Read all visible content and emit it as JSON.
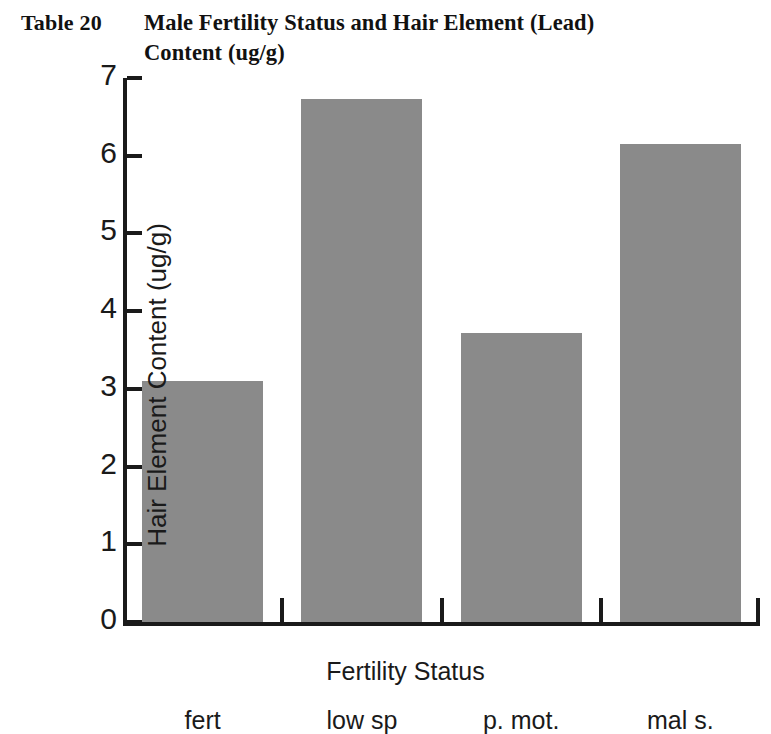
{
  "title": {
    "table_number": "Table 20",
    "line1": "Male Fertility Status and Hair Element (Lead)",
    "line2": "Content (ug/g)"
  },
  "colors": {
    "bar_fill": "#8a8a8a",
    "axis": "#1a1a1a",
    "background": "#ffffff",
    "text": "#1a1a1a"
  },
  "axis": {
    "y_ticks": [
      "0",
      "1",
      "2",
      "3",
      "4",
      "5",
      "6",
      "7"
    ],
    "y_title": "Hair Element Content (ug/g)",
    "x_title": "Fertility Status",
    "x_labels": [
      "fert",
      "low sp",
      "p. mot.",
      "mal s."
    ]
  },
  "chart_data": {
    "type": "bar",
    "title": "Male Fertility Status and Hair Element (Lead) Content (ug/g)",
    "categories": [
      "fert",
      "low sp",
      "p. mot.",
      "mal s."
    ],
    "values": [
      3.1,
      6.73,
      3.72,
      6.15
    ],
    "xlabel": "Fertility Status",
    "ylabel": "Hair Element Content (ug/g)",
    "ylim": [
      0,
      7
    ],
    "ytick_step": 1,
    "grid": false,
    "legend": false,
    "series_color": "#8a8a8a"
  }
}
